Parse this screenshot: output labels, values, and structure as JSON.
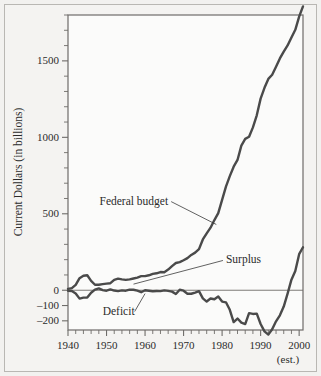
{
  "chart_data": {
    "type": "line",
    "title": "",
    "xlabel": "",
    "ylabel": "Current Dollars (in billions)",
    "xlim": [
      1940,
      2001
    ],
    "ylim": [
      -260,
      1800
    ],
    "grid": false,
    "legend_position": "inline-annotations",
    "x_ticks": [
      1940,
      1950,
      1960,
      1970,
      1980,
      1990,
      2000
    ],
    "x_tick_labels": [
      "1940",
      "1950",
      "1960",
      "1970",
      "1980",
      "1990",
      "2000"
    ],
    "x_minor_tick_interval": 2,
    "y_ticks": [
      -200,
      -100,
      0,
      500,
      1000,
      1500
    ],
    "y_tick_labels": [
      "–200",
      "–100",
      "0",
      "500",
      "1000",
      "1500"
    ],
    "y_minor_tick_interval": 100,
    "x_axis_note": "(est.)",
    "zero_line": 0,
    "series": [
      {
        "name": "Federal budget",
        "color": "#4a4a4a",
        "annotation": "Federal budget",
        "x": [
          1940,
          1941,
          1942,
          1943,
          1944,
          1945,
          1946,
          1947,
          1948,
          1949,
          1950,
          1951,
          1952,
          1953,
          1954,
          1955,
          1956,
          1957,
          1958,
          1959,
          1960,
          1961,
          1962,
          1963,
          1964,
          1965,
          1966,
          1967,
          1968,
          1969,
          1970,
          1971,
          1972,
          1973,
          1974,
          1975,
          1976,
          1977,
          1978,
          1979,
          1980,
          1981,
          1982,
          1983,
          1984,
          1985,
          1986,
          1987,
          1988,
          1989,
          1990,
          1991,
          1992,
          1993,
          1994,
          1995,
          1996,
          1997,
          1998,
          1999,
          2000,
          2001
        ],
        "values": [
          9,
          14,
          35,
          79,
          95,
          98,
          61,
          36,
          36,
          40,
          43,
          46,
          68,
          76,
          71,
          68,
          71,
          77,
          83,
          92,
          92,
          98,
          107,
          111,
          119,
          118,
          135,
          158,
          178,
          184,
          196,
          210,
          231,
          246,
          269,
          332,
          372,
          409,
          459,
          504,
          591,
          678,
          746,
          808,
          852,
          946,
          990,
          1004,
          1065,
          1144,
          1253,
          1324,
          1382,
          1409,
          1462,
          1516,
          1561,
          1601,
          1653,
          1703,
          1789,
          1856
        ]
      },
      {
        "name": "Surplus or Deficit",
        "color": "#4a4a4a",
        "annotation_surplus": "Surplus",
        "annotation_deficit": "Deficit",
        "x": [
          1940,
          1941,
          1942,
          1943,
          1944,
          1945,
          1946,
          1947,
          1948,
          1949,
          1950,
          1951,
          1952,
          1953,
          1954,
          1955,
          1956,
          1957,
          1958,
          1959,
          1960,
          1961,
          1962,
          1963,
          1964,
          1965,
          1966,
          1967,
          1968,
          1969,
          1970,
          1971,
          1972,
          1973,
          1974,
          1975,
          1976,
          1977,
          1978,
          1979,
          1980,
          1981,
          1982,
          1983,
          1984,
          1985,
          1986,
          1987,
          1988,
          1989,
          1990,
          1991,
          1992,
          1993,
          1994,
          1995,
          1996,
          1997,
          1998,
          1999,
          2000,
          2001
        ],
        "values": [
          -3,
          -5,
          -21,
          -55,
          -48,
          -48,
          -16,
          4,
          12,
          1,
          -3,
          6,
          -2,
          -6,
          -1,
          -3,
          4,
          3,
          -3,
          -13,
          0,
          -3,
          -7,
          -5,
          -6,
          -1,
          -4,
          -9,
          -25,
          3,
          -3,
          -23,
          -23,
          -15,
          -6,
          -53,
          -74,
          -54,
          -59,
          -41,
          -74,
          -79,
          -128,
          -208,
          -185,
          -212,
          -221,
          -150,
          -155,
          -153,
          -221,
          -269,
          -290,
          -255,
          -203,
          -164,
          -107,
          -22,
          69,
          126,
          236,
          281
        ]
      }
    ],
    "annotations": [
      {
        "text": "Federal budget",
        "x": 1966,
        "y": 560
      },
      {
        "text": "Surplus",
        "x": 1981,
        "y": 175
      },
      {
        "text": "Deficit",
        "x": 1949,
        "y": -165
      },
      {
        "text": "(est.)",
        "x": 2000,
        "y": -330
      }
    ]
  },
  "axis": {
    "y_title": "Current Dollars (in billions)",
    "x_note": "(est.)"
  },
  "colors": {
    "line": "#4a4a4a",
    "frame": "#6e6c69",
    "outer_border": "#b9b7b3",
    "background": "#f4f3f1",
    "plot_background": "#fbfbfa",
    "text": "#2b2b2b"
  }
}
